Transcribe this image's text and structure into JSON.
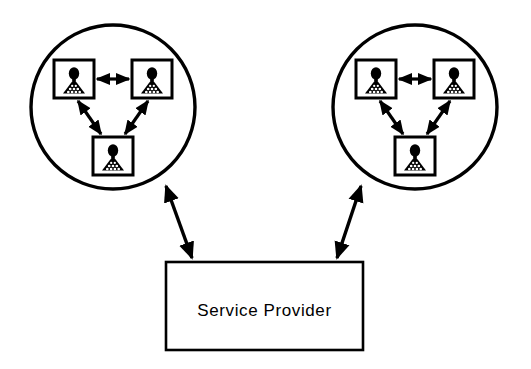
{
  "diagram": {
    "type": "node-link-diagram",
    "background_color": "#ffffff",
    "stroke_color": "#000000",
    "service_provider": {
      "label": "Service  Provider",
      "shape": "rectangle",
      "x": 166,
      "y": 262,
      "width": 197,
      "height": 88
    },
    "groups": [
      {
        "id": "left-group",
        "shape": "circle",
        "cx": 113,
        "cy": 107,
        "r": 82,
        "nodes": [
          {
            "id": "left-node-top-left",
            "icon": "user-icon",
            "x": 54,
            "y": 60,
            "width": 40,
            "height": 38
          },
          {
            "id": "left-node-top-right",
            "icon": "user-icon",
            "x": 132,
            "y": 60,
            "width": 40,
            "height": 38
          },
          {
            "id": "left-node-bottom",
            "icon": "user-icon",
            "x": 93,
            "y": 137,
            "width": 40,
            "height": 38
          }
        ],
        "links": [
          {
            "from": "left-node-top-left",
            "to": "left-node-top-right",
            "arrow": "double"
          },
          {
            "from": "left-node-top-left",
            "to": "left-node-bottom",
            "arrow": "double"
          },
          {
            "from": "left-node-top-right",
            "to": "left-node-bottom",
            "arrow": "double"
          }
        ]
      },
      {
        "id": "right-group",
        "shape": "circle",
        "cx": 415,
        "cy": 107,
        "r": 82,
        "nodes": [
          {
            "id": "right-node-top-left",
            "icon": "user-icon",
            "x": 356,
            "y": 60,
            "width": 40,
            "height": 38
          },
          {
            "id": "right-node-top-right",
            "icon": "user-icon",
            "x": 434,
            "y": 60,
            "width": 40,
            "height": 38
          },
          {
            "id": "right-node-bottom",
            "icon": "user-icon",
            "x": 395,
            "y": 137,
            "width": 40,
            "height": 38
          }
        ],
        "links": [
          {
            "from": "right-node-top-left",
            "to": "right-node-top-right",
            "arrow": "double"
          },
          {
            "from": "right-node-top-left",
            "to": "right-node-bottom",
            "arrow": "double"
          },
          {
            "from": "right-node-top-right",
            "to": "right-node-bottom",
            "arrow": "double"
          }
        ]
      }
    ],
    "connectors": [
      {
        "id": "left-connector",
        "from": "left-group",
        "to": "service_provider",
        "arrow": "double"
      },
      {
        "id": "right-connector",
        "from": "right-group",
        "to": "service_provider",
        "arrow": "double"
      }
    ]
  }
}
